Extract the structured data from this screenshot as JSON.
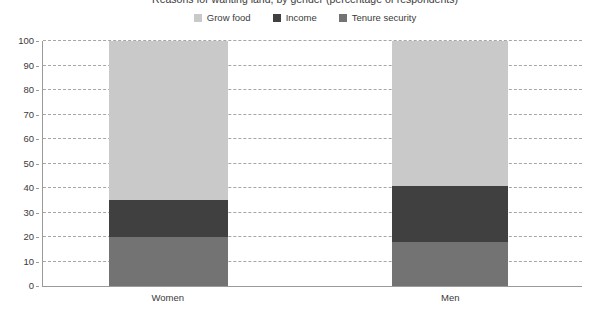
{
  "title": {
    "text": "Reasons for wanting land, by gender (percentage of respondents)",
    "cropped": true
  },
  "legend": {
    "position": "top-center",
    "items": [
      {
        "label": "Grow food",
        "color": "#c9c9c9",
        "icon": "square-swatch-icon"
      },
      {
        "label": "Income",
        "color": "#404040",
        "icon": "square-swatch-icon"
      },
      {
        "label": "Tenure security",
        "color": "#737373",
        "icon": "square-swatch-icon"
      }
    ]
  },
  "axes": {
    "y_ticks": [
      "100",
      "90",
      "80",
      "70",
      "60",
      "50",
      "40",
      "30",
      "20",
      "10",
      "0"
    ],
    "x_labels": [
      "Women",
      "Men"
    ]
  },
  "chart_data": {
    "type": "bar",
    "stacked": true,
    "title": "Reasons for wanting land, by gender (percentage of respondents)",
    "xlabel": "",
    "ylabel": "",
    "ylim": [
      0,
      100
    ],
    "ytick_step": 10,
    "grid": "horizontal-dashed",
    "legend_position": "top-center",
    "categories": [
      "Women",
      "Men"
    ],
    "stack_order_bottom_to_top": [
      "Tenure security",
      "Income",
      "Grow food"
    ],
    "series": [
      {
        "name": "Grow food",
        "color": "#c9c9c9",
        "values": [
          65,
          59
        ]
      },
      {
        "name": "Income",
        "color": "#404040",
        "values": [
          15,
          23
        ]
      },
      {
        "name": "Tenure security",
        "color": "#737373",
        "values": [
          20,
          18
        ]
      }
    ],
    "cumulative_boundaries": {
      "Women": {
        "tenure_security_top": 20,
        "income_top": 35,
        "grow_food_top": 100
      },
      "Men": {
        "tenure_security_top": 18,
        "income_top": 41,
        "grow_food_top": 100
      }
    }
  },
  "colors": {
    "grow_food": "#c9c9c9",
    "income": "#404040",
    "tenure_security": "#737373",
    "axis": "#9a9a9a",
    "gridline": "#a6a6a6",
    "text": "#3a3a3a",
    "background": "#ffffff"
  },
  "layout": {
    "bars": [
      {
        "category": "Women",
        "left_pct": 12.2,
        "width_pct": 22.2,
        "center_pct": 23.3
      },
      {
        "category": "Men",
        "left_pct": 64.8,
        "width_pct": 21.5,
        "center_pct": 75.6
      }
    ]
  }
}
